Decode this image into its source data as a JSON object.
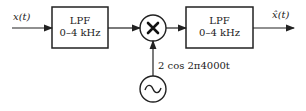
{
  "diagram": {
    "input_label": "x(t)",
    "output_label": "x̂(t)",
    "blocks": [
      {
        "id": "lpf1",
        "title": "LPF",
        "range": "0–4 kHz"
      },
      {
        "id": "lpf2",
        "title": "LPF",
        "range": "0–4 kHz"
      }
    ],
    "multiplier_symbol": "×",
    "oscillator_symbol": "~",
    "oscillator_label": "2 cos 2π4000t"
  }
}
